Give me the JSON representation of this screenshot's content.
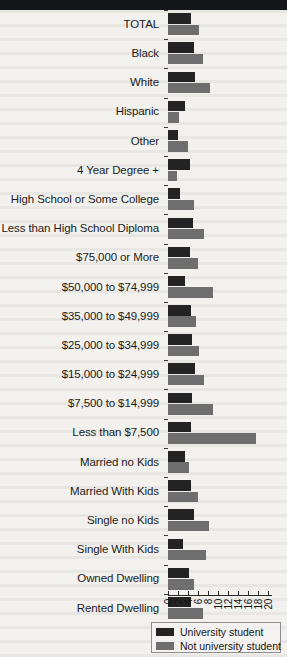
{
  "banner": {
    "label": ""
  },
  "legend": {
    "position": "bottom-right",
    "items": [
      {
        "label": "University student",
        "color": "#232323",
        "name": "legend-university-student"
      },
      {
        "label": "Not university student",
        "color": "#6e6e6e",
        "name": "legend-not-university-student"
      }
    ]
  },
  "chart_data": {
    "type": "bar",
    "orientation": "horizontal",
    "title": "",
    "subtitle": "",
    "xlabel": "",
    "ylabel": "",
    "xlim": [
      0,
      20
    ],
    "grid": false,
    "legend_position": "bottom-right",
    "axis_ticks": [
      "0",
      "2",
      "4",
      "6",
      "8",
      "10",
      "12",
      "14",
      "16",
      "18",
      "20"
    ],
    "axis_tick_values": [
      0,
      2,
      4,
      6,
      8,
      10,
      12,
      14,
      16,
      18,
      20
    ],
    "categories": [
      "TOTAL",
      "Black",
      "White",
      "Hispanic",
      "Other",
      "4 Year Degree +",
      "High School or Some College",
      "Less than High School Diploma",
      "$75,000 or More",
      "$50,000 to $74,999",
      "$35,000 to $49,999",
      "$25,000 to $34,999",
      "$15,000 to $24,999",
      "$7,500 to $14,999",
      "Less than $7,500",
      "Married no Kids",
      "Married With Kids",
      "Single no Kids",
      "Single With Kids",
      "Owned Dwelling",
      "Rented Dwelling"
    ],
    "series": [
      {
        "name": "University student",
        "color": "#232323",
        "values": [
          4.6,
          5.2,
          5.4,
          3.4,
          2.0,
          4.4,
          2.4,
          5.0,
          4.4,
          3.4,
          4.6,
          4.8,
          5.4,
          4.8,
          4.6,
          3.4,
          4.6,
          5.2,
          3.0,
          4.2,
          4.6
        ]
      },
      {
        "name": "Not university student",
        "color": "#6e6e6e",
        "values": [
          6.2,
          7.0,
          8.4,
          2.2,
          4.0,
          1.8,
          5.2,
          7.2,
          6.0,
          9.0,
          5.6,
          6.2,
          7.2,
          9.0,
          17.6,
          4.2,
          6.0,
          8.2,
          7.6,
          5.2,
          7.0
        ]
      }
    ]
  }
}
